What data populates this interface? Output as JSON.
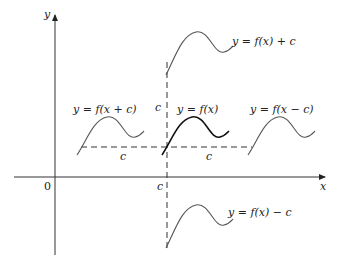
{
  "diagram": {
    "axes": {
      "x_label": "x",
      "y_label": "y",
      "origin_label": "0"
    },
    "shift_label": "c",
    "curves": [
      {
        "id": "original",
        "label": "y = f(x)",
        "emphasis": true
      },
      {
        "id": "shift-up",
        "label": "y = f(x) + c"
      },
      {
        "id": "shift-down",
        "label": "y = f(x) − c"
      },
      {
        "id": "shift-left",
        "label": "y = f(x + c)"
      },
      {
        "id": "shift-right",
        "label": "y = f(x − c)"
      }
    ],
    "guides": {
      "vertical_dashed_x_label": "c",
      "upper_vertical_label": "c",
      "left_horizontal_label": "c",
      "right_horizontal_label": "c"
    },
    "colors": {
      "background": "#ffffff",
      "axis": "#333333",
      "curve_main": "#111111",
      "curve_shifted": "#555555"
    }
  }
}
